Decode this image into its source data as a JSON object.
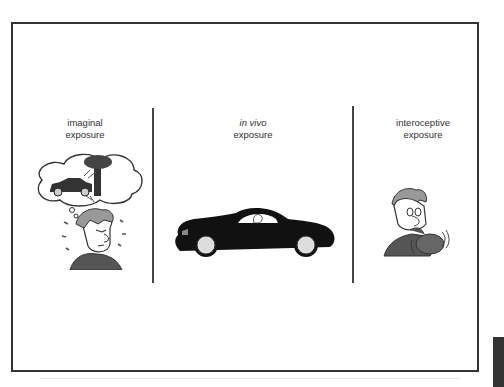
{
  "figure": {
    "panels": [
      {
        "title_line1": "imaginal",
        "title_line2": "exposure",
        "illustration": "worried-man-imagining-car-crash"
      },
      {
        "title_line1": "in vivo",
        "title_line2": "exposure",
        "illustration": "person-driving-black-car"
      },
      {
        "title_line1": "interoceptive",
        "title_line2": "exposure",
        "illustration": "man-breathing-into-bag"
      }
    ],
    "colors": {
      "border": "#333333",
      "car": "#111111",
      "wheel": "#dddddd",
      "shirt": "#555555",
      "hair": "#999999"
    }
  }
}
